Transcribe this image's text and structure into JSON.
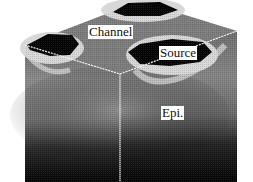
{
  "figure": {
    "labels": {
      "channel": "Channel",
      "source": "Source",
      "epi": "Epi."
    },
    "colors": {
      "background": "#ffffff",
      "dark_region": "#050505",
      "mid_gray": "#7a7a7a",
      "light_rim": "#d8d8d8",
      "edge_line": "#f2f2f2"
    }
  }
}
